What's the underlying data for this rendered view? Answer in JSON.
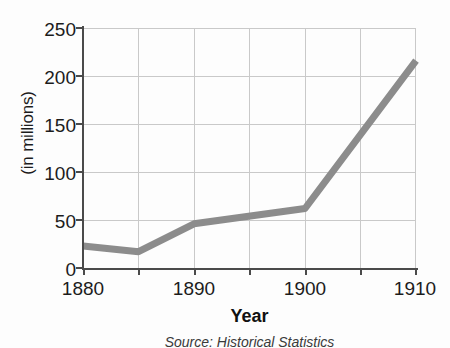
{
  "chart_data": {
    "type": "line",
    "title": "",
    "xlabel": "Year",
    "ylabel": "(in millions)",
    "source_note": "Source: Historical Statistics",
    "x": [
      1880,
      1885,
      1890,
      1900,
      1910
    ],
    "values": [
      23,
      17,
      46,
      62,
      216
    ],
    "series": [
      {
        "name": "",
        "x": [
          1880,
          1885,
          1890,
          1900,
          1910
        ],
        "values": [
          23,
          17,
          46,
          62,
          216
        ],
        "color": "#8c8c8c"
      }
    ],
    "xlim": [
      1880,
      1910
    ],
    "ylim": [
      0,
      250
    ],
    "xticks": [
      1880,
      1890,
      1900,
      1910
    ],
    "xtick_labels": [
      "1880",
      "1890",
      "1900",
      "1910"
    ],
    "yticks": [
      0,
      50,
      100,
      150,
      200,
      250
    ],
    "ytick_labels": [
      "0",
      "50",
      "100",
      "150",
      "200",
      "250"
    ],
    "x_minor_gridlines": [
      1885,
      1895,
      1905
    ],
    "grid": true,
    "legend": "none",
    "colors": {
      "line": "#8c8c8c",
      "grid": "#c9c9c9",
      "axis": "#4a4a4a",
      "text": "#1c1c1c",
      "background": "#fdfdfd"
    }
  }
}
